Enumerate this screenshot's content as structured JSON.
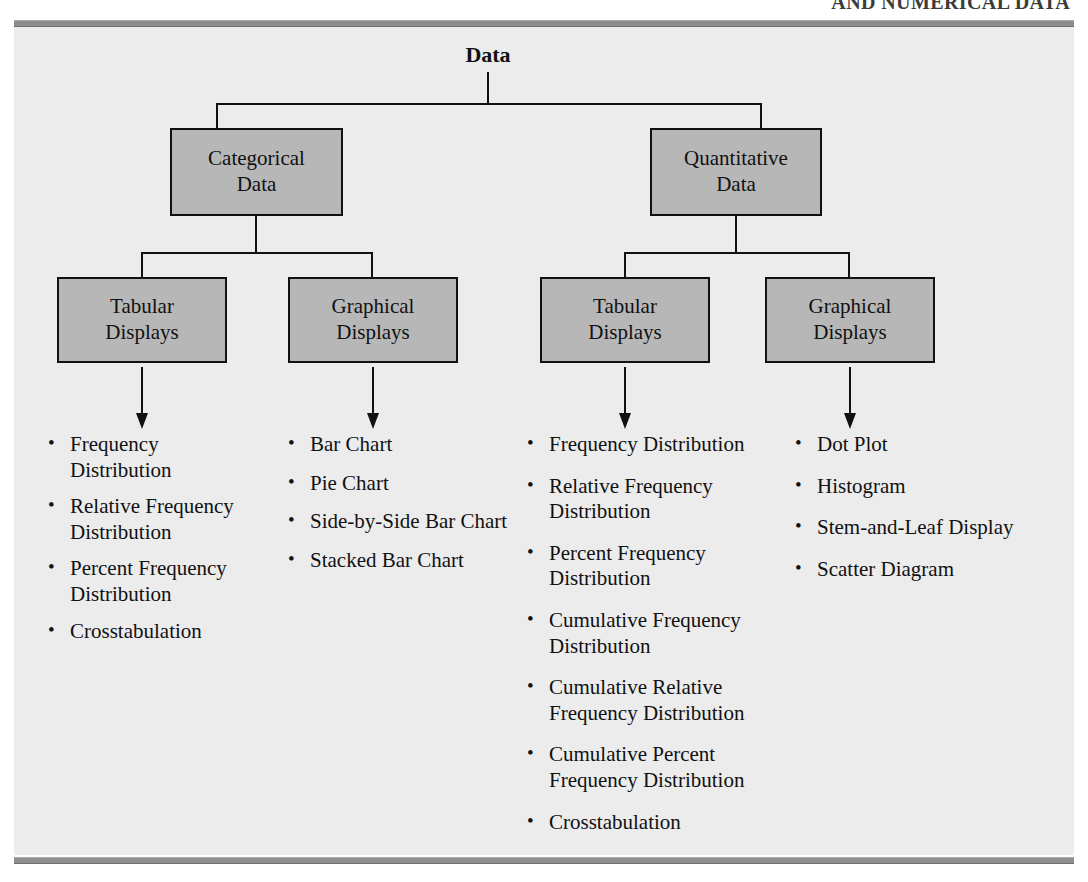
{
  "running_head": "AND NUMERICAL DATA",
  "figure": {
    "root_label": "Data",
    "level1": [
      {
        "label_line1": "Categorical",
        "label_line2": "Data"
      },
      {
        "label_line1": "Quantitative",
        "label_line2": "Data"
      }
    ],
    "level2": [
      {
        "label_line1": "Tabular",
        "label_line2": "Displays"
      },
      {
        "label_line1": "Graphical",
        "label_line2": "Displays"
      },
      {
        "label_line1": "Tabular",
        "label_line2": "Displays"
      },
      {
        "label_line1": "Graphical",
        "label_line2": "Displays"
      }
    ],
    "lists": {
      "categorical_tabular": [
        "Frequency Distribution",
        "Relative Frequency Distribution",
        "Percent Frequency Distribution",
        "Crosstabulation"
      ],
      "categorical_graphical": [
        "Bar Chart",
        "Pie Chart",
        "Side-by-Side Bar Chart",
        "Stacked Bar Chart"
      ],
      "quantitative_tabular": [
        "Frequency Distribution",
        "Relative Frequency Distribution",
        "Percent Frequency Distribution",
        "Cumulative Frequency Distribution",
        "Cumulative Relative Frequency Distribution",
        "Cumulative Percent Frequency Distribution",
        "Crosstabulation"
      ],
      "quantitative_graphical": [
        "Dot Plot",
        "Histogram",
        "Stem-and-Leaf Display",
        "Scatter Diagram"
      ]
    }
  },
  "colors": {
    "panel_background": "#ececed",
    "node_fill": "#b7b7b7",
    "node_border": "#111111",
    "rule": "#8e8e8e",
    "text": "#111111"
  }
}
